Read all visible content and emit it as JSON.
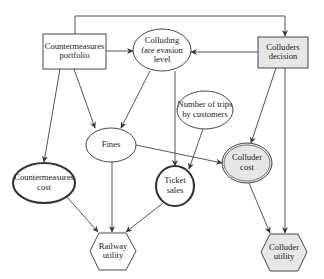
{
  "diagram": {
    "type": "influence-diagram",
    "colors": {
      "stroke": "#333333",
      "decision_fill_player": "#e6e6e6",
      "node_fill": "#ffffff"
    },
    "nodes": {
      "countermeasures_portfolio": {
        "label": "Countermeasures\nportfolio",
        "shape": "rectangle",
        "kind": "decision"
      },
      "colluders_decision": {
        "label": "Colluders\ndecision",
        "shape": "rectangle",
        "kind": "decision",
        "shaded": true
      },
      "colluding_fare_evasion_level": {
        "label": "Colluding\nfare evasion\nlevel",
        "shape": "ellipse",
        "kind": "chance"
      },
      "number_of_trips": {
        "label": "Number of trips\nby customers",
        "shape": "ellipse",
        "kind": "chance"
      },
      "fines": {
        "label": "Fines",
        "shape": "ellipse",
        "kind": "chance"
      },
      "colluder_cost": {
        "label": "Colluder\ncost",
        "shape": "ellipse",
        "kind": "deterministic",
        "shaded": true
      },
      "countermeasures_cost": {
        "label": "Countermeasures\ncost",
        "shape": "ellipse",
        "kind": "deterministic"
      },
      "ticket_sales": {
        "label": "Ticket\nsales",
        "shape": "ellipse",
        "kind": "deterministic"
      },
      "railway_utility": {
        "label": "Railway\nutility",
        "shape": "hexagon",
        "kind": "utility"
      },
      "colluder_utility": {
        "label": "Colluder\nutility",
        "shape": "hexagon",
        "kind": "utility",
        "shaded": true
      }
    },
    "edges": [
      {
        "from": "countermeasures_portfolio",
        "to": "colluders_decision"
      },
      {
        "from": "countermeasures_portfolio",
        "to": "colluding_fare_evasion_level"
      },
      {
        "from": "colluders_decision",
        "to": "colluding_fare_evasion_level"
      },
      {
        "from": "countermeasures_portfolio",
        "to": "countermeasures_cost"
      },
      {
        "from": "countermeasures_portfolio",
        "to": "fines"
      },
      {
        "from": "colluding_fare_evasion_level",
        "to": "fines"
      },
      {
        "from": "colluding_fare_evasion_level",
        "to": "ticket_sales"
      },
      {
        "from": "number_of_trips",
        "to": "ticket_sales"
      },
      {
        "from": "colluders_decision",
        "to": "colluder_cost"
      },
      {
        "from": "fines",
        "to": "colluder_cost"
      },
      {
        "from": "countermeasures_cost",
        "to": "railway_utility"
      },
      {
        "from": "fines",
        "to": "railway_utility"
      },
      {
        "from": "ticket_sales",
        "to": "railway_utility"
      },
      {
        "from": "colluder_cost",
        "to": "colluder_utility"
      },
      {
        "from": "colluders_decision",
        "to": "colluder_utility"
      }
    ]
  }
}
